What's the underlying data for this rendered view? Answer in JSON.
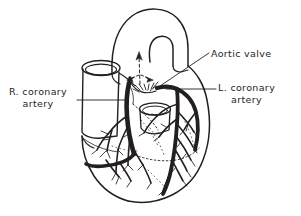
{
  "figure": {
    "background_color": "#ffffff",
    "ink_color": "#231f20",
    "width": 301,
    "height": 216
  },
  "labels": {
    "aortic_valve": {
      "name": "Aortic valve",
      "lines": [
        "Aortic valve"
      ],
      "align": "left"
    },
    "left_coronary": {
      "name": "L. coronary artery",
      "lines": [
        "L. coronary",
        "artery"
      ],
      "align": "center"
    },
    "right_coronary": {
      "name": "R. coronary artery",
      "lines": [
        "R. coronary",
        "artery"
      ],
      "align": "center"
    }
  },
  "anatomy": {
    "structures": [
      "aortic arch",
      "ascending aorta",
      "cut vessel stump (superior vena cava / pulmonary trunk)",
      "cut vessel stump (pulmonary vein)",
      "right coronary artery",
      "left coronary artery",
      "anterior interventricular branch",
      "circumflex branch",
      "ventricular myocardium",
      "coronary capillary branches"
    ],
    "flow_arrows": {
      "style": "dashed",
      "count": 3,
      "description": "blood flow up the aorta and out through both coronary ostia"
    }
  },
  "leader_lines": {
    "aortic_valve": "diagonal from label left edge down-left to aortic valve",
    "left_coronary": "horizontal from label left edge to left coronary artery origin",
    "right_coronary": "horizontal from label right edge to right coronary artery origin"
  }
}
